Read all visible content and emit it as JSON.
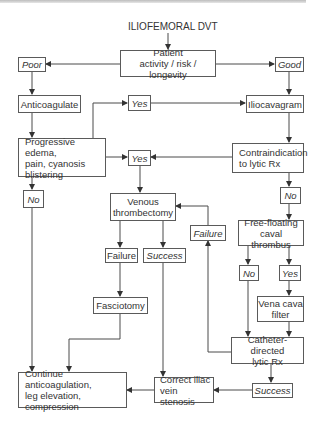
{
  "diagram": {
    "title": "ILIOFEMORAL DVT",
    "nodes": {
      "patient": "Patient\nactivity / risk / longevity",
      "poor": "Poor",
      "good": "Good",
      "anticoagulate": "Anticoagulate",
      "yes_top": "Yes",
      "iliocavagram": "Iliocavagram",
      "progressive": "Progressive edema,\npain, cyanosis\nblistering",
      "yes_mid": "Yes",
      "contraindication": "Contraindication\nto lytic Rx",
      "no_left": "No",
      "no_right": "No",
      "venous": "Venous\nthrombectomy",
      "failure_right": "Failure",
      "freefloating": "Free-floating\ncaval thrombus",
      "failure_left": "Failure",
      "success_mid": "Success",
      "no_lower": "No",
      "yes_lower": "Yes",
      "fasciotomy": "Fasciotomy",
      "venacava": "Vena cava\nfilter",
      "catheter": "Catheter-directed\nlytic Rx",
      "continue": "Continue anticoagulation,\nleg elevation,\ncompression",
      "correct": "Correct iliac\nvein stenosis",
      "success_bottom": "Success"
    },
    "colors": {
      "line": "#4a4a4a",
      "border": "#5a5a5a",
      "text": "#333333"
    }
  }
}
